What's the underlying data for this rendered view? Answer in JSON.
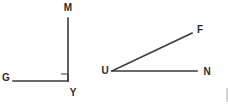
{
  "canvas": {
    "width": 228,
    "height": 110,
    "background_color": "#ffffff",
    "line_color": "#3a3a3a",
    "label_color": "#2b2b2b"
  },
  "figures": [
    {
      "id": "angle-gym",
      "name": "right-angle-figure",
      "angle_name": "GYM",
      "angle_type": "right",
      "angle_degrees": 90,
      "vertex": {
        "label": "Y",
        "x": 68,
        "y": 81,
        "label_x": 73,
        "label_y": 93
      },
      "rays": [
        {
          "name": "ray-y-m",
          "endpoint_label": "M",
          "from_x": 68,
          "from_y": 81,
          "to_x": 68,
          "to_y": 18,
          "label_x": 68,
          "label_y": 8
        },
        {
          "name": "ray-y-g",
          "endpoint_label": "G",
          "from_x": 68,
          "from_y": 81,
          "to_x": 13,
          "to_y": 81,
          "label_x": 6,
          "label_y": 78
        }
      ],
      "right_angle_marker": {
        "shown": true,
        "x": 61,
        "y": 74,
        "size": 7
      }
    },
    {
      "id": "angle-fun",
      "name": "acute-angle-figure",
      "angle_name": "FUN",
      "angle_type": "acute",
      "angle_degrees": 24,
      "vertex": {
        "label": "U",
        "x": 112,
        "y": 71,
        "label_x": 105,
        "label_y": 71
      },
      "rays": [
        {
          "name": "ray-u-f",
          "endpoint_label": "F",
          "from_x": 112,
          "from_y": 71,
          "to_x": 192,
          "to_y": 33,
          "label_x": 200,
          "label_y": 30
        },
        {
          "name": "ray-u-n",
          "endpoint_label": "N",
          "from_x": 112,
          "from_y": 71,
          "to_x": 197,
          "to_y": 71,
          "label_x": 207,
          "label_y": 72
        }
      ],
      "right_angle_marker": {
        "shown": false
      }
    }
  ]
}
